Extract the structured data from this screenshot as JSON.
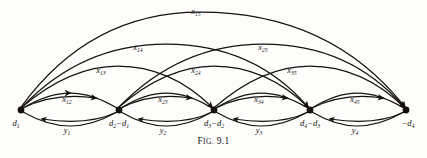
{
  "figure": {
    "caption_prefix": "F",
    "caption_small": "IG.",
    "caption_number": "9.1",
    "caption_full": "FIG. 9.1",
    "ink_color": "#14110f",
    "background_color": "#fdfdfc"
  },
  "nodes": [
    {
      "id": "n1",
      "label_main": "d",
      "label_sub": "1",
      "label_prefix": "",
      "x": 21,
      "y": 110,
      "text": "d₁"
    },
    {
      "id": "n2",
      "label_main": "d",
      "label_sub": "2",
      "label_prefix": "",
      "x": 119,
      "y": 110,
      "text": "d₂−d₁"
    },
    {
      "id": "n3",
      "label_main": "d",
      "label_sub": "3",
      "label_prefix": "",
      "x": 214,
      "y": 110,
      "text": "d₃−d₂"
    },
    {
      "id": "n4",
      "label_main": "d",
      "label_sub": "4",
      "label_prefix": "",
      "x": 310,
      "y": 110,
      "text": "d₄−d₃"
    },
    {
      "id": "n5",
      "label_main": "d",
      "label_sub": "4",
      "label_prefix": "−",
      "x": 406,
      "y": 110,
      "text": "−d₄"
    }
  ],
  "node_labels": [
    {
      "base": "d",
      "sub": "1",
      "minus_before": false,
      "second_base": "",
      "second_sub": ""
    },
    {
      "base": "d",
      "sub": "2",
      "minus_before": false,
      "second_base": "d",
      "second_sub": "1"
    },
    {
      "base": "d",
      "sub": "3",
      "minus_before": false,
      "second_base": "d",
      "second_sub": "2"
    },
    {
      "base": "d",
      "sub": "4",
      "minus_before": false,
      "second_base": "d",
      "second_sub": "3"
    },
    {
      "base": "d",
      "sub": "4",
      "minus_before": true,
      "second_base": "",
      "second_sub": ""
    }
  ],
  "forward_arcs": [
    {
      "name": "x12",
      "base": "x",
      "sub": "12",
      "from": 1,
      "to": 2,
      "label_x": 67,
      "label_y": 102
    },
    {
      "name": "x23",
      "base": "x",
      "sub": "23",
      "from": 2,
      "to": 3,
      "label_x": 163,
      "label_y": 102
    },
    {
      "name": "x34",
      "base": "x",
      "sub": "34",
      "from": 3,
      "to": 4,
      "label_x": 259,
      "label_y": 102
    },
    {
      "name": "x45",
      "base": "x",
      "sub": "45",
      "from": 4,
      "to": 5,
      "label_x": 355,
      "label_y": 102
    },
    {
      "name": "x13",
      "base": "x",
      "sub": "13",
      "from": 1,
      "to": 3,
      "label_x": 101,
      "label_y": 73
    },
    {
      "name": "x24",
      "base": "x",
      "sub": "24",
      "from": 2,
      "to": 4,
      "label_x": 196,
      "label_y": 73
    },
    {
      "name": "x35",
      "base": "x",
      "sub": "35",
      "from": 3,
      "to": 5,
      "label_x": 292,
      "label_y": 73
    },
    {
      "name": "x14",
      "base": "x",
      "sub": "14",
      "from": 1,
      "to": 4,
      "label_x": 138,
      "label_y": 50
    },
    {
      "name": "x25",
      "base": "x",
      "sub": "25",
      "from": 2,
      "to": 5,
      "label_x": 263,
      "label_y": 50
    },
    {
      "name": "x15",
      "base": "x",
      "sub": "15",
      "from": 1,
      "to": 5,
      "label_x": 196,
      "label_y": 14
    }
  ],
  "return_arcs": [
    {
      "name": "y1",
      "base": "y",
      "sub": "1",
      "from": 2,
      "to": 1,
      "label_x": 67,
      "label_y": 131
    },
    {
      "name": "y2",
      "base": "y",
      "sub": "2",
      "from": 3,
      "to": 2,
      "label_x": 163,
      "label_y": 131
    },
    {
      "name": "y3",
      "base": "y",
      "sub": "3",
      "from": 4,
      "to": 3,
      "label_x": 259,
      "label_y": 131
    },
    {
      "name": "y4",
      "base": "y",
      "sub": "4",
      "from": 5,
      "to": 4,
      "label_x": 355,
      "label_y": 131
    }
  ],
  "labels_flat": {
    "x12": "x12",
    "x13": "x13",
    "x14": "x14",
    "x15": "x15",
    "x23": "x23",
    "x24": "x24",
    "x25": "x25",
    "x34": "x34",
    "x35": "x35",
    "x45": "x45",
    "y1": "y1",
    "y2": "y2",
    "y3": "y3",
    "y4": "y4"
  }
}
